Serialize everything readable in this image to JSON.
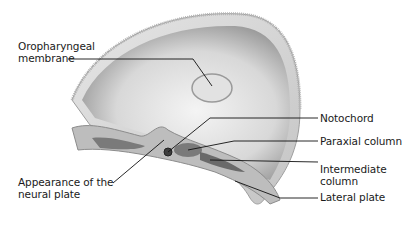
{
  "diagram": {
    "colors": {
      "background": "#ffffff",
      "shell_outer": "#d9d9d9",
      "shell_inner": "#bfbfbf",
      "cavity_light": "#ececec",
      "cavity_dark": "#8a8a8a",
      "mesoderm": "#7a7a7a",
      "ectoderm": "#a9a9a9",
      "leader_line": "#111111",
      "text": "#1a1a1a"
    },
    "labels": {
      "oropharyngeal_line1": "Oropharyngeal",
      "oropharyngeal_line2": "membrane",
      "notochord": "Notochord",
      "paraxial": "Paraxial column",
      "intermediate_line1": "Intermediate",
      "intermediate_line2": "column",
      "lateral": "Lateral plate",
      "neural_line1": "Appearance of the",
      "neural_line2": "neural plate"
    }
  }
}
